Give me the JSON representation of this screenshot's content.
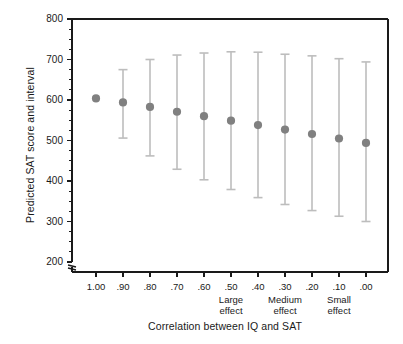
{
  "chart_data": {
    "type": "scatter",
    "title": "",
    "xlabel": "Correlation between IQ and SAT",
    "ylabel": "Predicted SAT score and interval",
    "categories": [
      "1.00",
      ".90",
      ".80",
      ".70",
      ".60",
      ".50",
      ".40",
      ".30",
      ".20",
      ".10",
      ".00"
    ],
    "category_annotations": [
      {
        "category": ".50",
        "line1": "Large",
        "line2": "effect"
      },
      {
        "category": ".30",
        "line1": "Medium",
        "line2": "effect"
      },
      {
        "category": ".10",
        "line1": "Small",
        "line2": "effect"
      }
    ],
    "values": [
      604,
      594,
      583,
      571,
      560,
      549,
      538,
      527,
      516,
      505,
      494
    ],
    "ci_lower": [
      604,
      506,
      462,
      429,
      403,
      379,
      359,
      342,
      327,
      313,
      300
    ],
    "ci_upper": [
      604,
      675,
      700,
      711,
      716,
      719,
      718,
      713,
      709,
      702,
      694
    ],
    "ylim": [
      200,
      800
    ],
    "yticks": [
      200,
      300,
      400,
      500,
      600,
      700,
      800
    ],
    "yminor_step": 25,
    "ytick_labels": [
      "200",
      "300",
      "400",
      "500",
      "600",
      "700",
      "800"
    ],
    "axis_break": true,
    "grid": false,
    "legend": "none",
    "marker_color": "#808080",
    "errorbar_color": "#bdbdbd",
    "axis_color": "#1a1a1a"
  }
}
